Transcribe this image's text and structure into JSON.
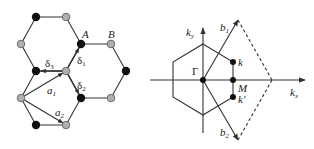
{
  "lattice": {
    "labels": {
      "A": "A",
      "B": "B",
      "delta1": "δ",
      "delta1_sub": "1",
      "delta2": "δ",
      "delta2_sub": "2",
      "delta3": "δ",
      "delta3_sub": "3",
      "a1": "a",
      "a1_sub": "1",
      "a2": "a",
      "a2_sub": "2"
    },
    "colors": {
      "sublattice_A": "#111111",
      "sublattice_B": "#a8a8a8",
      "bond": "#333333"
    }
  },
  "brillouin_zone": {
    "labels": {
      "ky": "k",
      "ky_sub": "y",
      "kx": "k",
      "kx_sub": "x",
      "gamma": "Γ",
      "k": "k",
      "k_prime": "k′",
      "M": "M",
      "b1": "b",
      "b1_sub": "1",
      "b2": "b",
      "b2_sub": "2"
    },
    "colors": {
      "line": "#333333",
      "point": "#111111"
    }
  }
}
